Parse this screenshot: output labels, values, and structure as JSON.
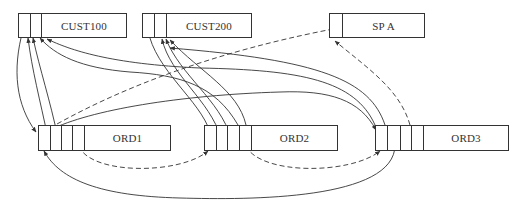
{
  "diagram": {
    "type": "record-pointer-chain",
    "records": {
      "cust100": {
        "label": "CUST100",
        "pointer_cells": 2
      },
      "cust200": {
        "label": "CUST200",
        "pointer_cells": 2
      },
      "spa": {
        "label": "SP A",
        "pointer_cells": 1
      },
      "ord1": {
        "label": "ORD1",
        "pointer_cells": 4
      },
      "ord2": {
        "label": "ORD2",
        "pointer_cells": 4
      },
      "ord3": {
        "label": "ORD3",
        "pointer_cells": 4
      }
    },
    "edges": [
      {
        "from": "CUST100",
        "to": "ORD1",
        "style": "solid"
      },
      {
        "from": "ORD1",
        "to": "CUST100",
        "style": "solid"
      },
      {
        "from": "ORD2",
        "to": "CUST100",
        "style": "solid"
      },
      {
        "from": "ORD3",
        "to": "CUST100",
        "style": "solid"
      },
      {
        "from": "CUST200",
        "to": "ORD2",
        "style": "solid"
      },
      {
        "from": "ORD2",
        "to": "CUST200",
        "style": "solid"
      },
      {
        "from": "ORD3",
        "to": "CUST200",
        "style": "solid"
      },
      {
        "from": "SP A",
        "to": "ORD1",
        "style": "dashed"
      },
      {
        "from": "ORD1",
        "to": "ORD2",
        "style": "dashed"
      },
      {
        "from": "ORD2",
        "to": "ORD3",
        "style": "dashed"
      },
      {
        "from": "ORD3",
        "to": "SP A",
        "style": "dashed"
      },
      {
        "from": "ORD3",
        "to": "ORD1",
        "style": "solid"
      }
    ]
  }
}
